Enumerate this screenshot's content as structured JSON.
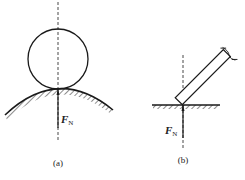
{
  "figure": {
    "panels": [
      {
        "id": "a",
        "caption": "(a)",
        "description": "Circle resting on a convex curved surface, normal force along common normal",
        "force_label": {
          "main": "F",
          "sub": "N"
        }
      },
      {
        "id": "b",
        "caption": "(b)",
        "description": "Inclined rod corner touching a flat surface, normal force perpendicular to surface",
        "force_label": {
          "main": "F",
          "sub": "N"
        }
      }
    ],
    "colors": {
      "line": "#1a1a1a",
      "background": "#ffffff"
    }
  }
}
